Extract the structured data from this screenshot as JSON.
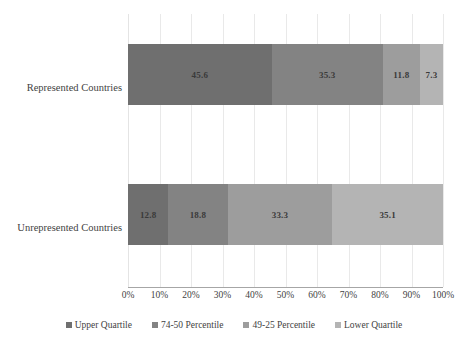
{
  "chart_data": {
    "type": "bar",
    "subtype": "horizontal-100-percent-stacked",
    "title": "",
    "xlabel": "",
    "ylabel": "",
    "categories": [
      "Represented Countries",
      "Unrepresented Countries"
    ],
    "series": [
      {
        "name": "Upper Quartile",
        "color": "#6f6f6f",
        "values": [
          45.6,
          12.8
        ]
      },
      {
        "name": "74-50 Percentile",
        "color": "#838383",
        "values": [
          35.3,
          18.8
        ]
      },
      {
        "name": "49-25 Percentile",
        "color": "#9d9d9d",
        "values": [
          11.8,
          33.3
        ]
      },
      {
        "name": "Lower Quartile",
        "color": "#b4b4b4",
        "values": [
          7.3,
          35.1
        ]
      }
    ],
    "xlim": [
      0,
      100
    ],
    "xticks": [
      0,
      10,
      20,
      30,
      40,
      50,
      60,
      70,
      80,
      90,
      100
    ],
    "xtick_labels": [
      "0%",
      "10%",
      "20%",
      "30%",
      "40%",
      "50%",
      "60%",
      "70%",
      "80%",
      "90%",
      "100%"
    ],
    "grid": true,
    "grid_axis": "x",
    "legend_position": "bottom",
    "data_labels": [
      [
        "45.6",
        "35.3",
        "11.8",
        "7.3"
      ],
      [
        "12.8",
        "18.8",
        "33.3",
        "35.1"
      ]
    ],
    "axis_line_color": "#a6a6a6",
    "gridline_color": "#e9e9e9",
    "text_color": "#3f3f3f"
  },
  "legend": {
    "items": [
      {
        "label": "Upper Quartile",
        "color": "#6f6f6f"
      },
      {
        "label": "74-50 Percentile",
        "color": "#838383"
      },
      {
        "label": "49-25 Percentile",
        "color": "#9d9d9d"
      },
      {
        "label": "Lower Quartile",
        "color": "#b4b4b4"
      }
    ]
  }
}
